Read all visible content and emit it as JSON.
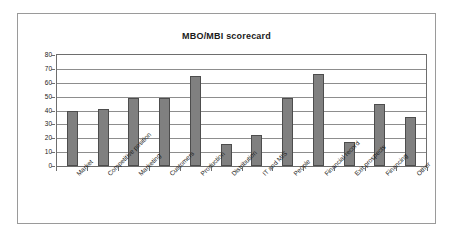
{
  "chart_data": {
    "type": "bar",
    "title": "MBO/MBI scorecard",
    "xlabel": "",
    "ylabel": "",
    "ylim": [
      0,
      80
    ],
    "ytick_step": 10,
    "yticks": [
      80,
      70,
      60,
      50,
      40,
      30,
      20,
      10,
      0
    ],
    "grid": true,
    "legend": false,
    "categories": [
      "Market",
      "Competitive position",
      "Marketing",
      "Customers",
      "Production",
      "Distribution",
      "IT and MIS",
      "People",
      "Financial record",
      "Exit prospects",
      "Financing",
      "Other"
    ],
    "values": [
      40,
      41,
      49,
      49,
      65,
      16,
      22,
      49,
      66,
      17,
      45,
      35
    ],
    "bar_color": "#808080",
    "bar_border_color": "#4d4d4d",
    "plot_border_color": "#6e6e6e",
    "gridline_color": "#8d8d8d",
    "frame_border_color": "#9a9a9a",
    "background": "#ffffff"
  }
}
